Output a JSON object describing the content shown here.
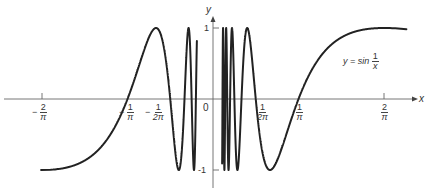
{
  "chart_data": {
    "type": "line",
    "function": "sin(1/x)",
    "xlabel": "x",
    "ylabel": "y",
    "xlim": [
      -0.65,
      0.72
    ],
    "ylim": [
      -1,
      1
    ],
    "x_ticks": [
      {
        "value": -0.6366,
        "label_sign": "-",
        "label_num": "2",
        "label_den": "π"
      },
      {
        "value": -0.3183,
        "label_sign": "-",
        "label_num": "1",
        "label_den": "π"
      },
      {
        "value": -0.1592,
        "label_sign": "-",
        "label_num": "1",
        "label_den": "2π"
      },
      {
        "value": 0.1592,
        "label_sign": "",
        "label_num": "1",
        "label_den": "2π"
      },
      {
        "value": 0.3183,
        "label_sign": "",
        "label_num": "1",
        "label_den": "π"
      },
      {
        "value": 0.6366,
        "label_sign": "",
        "label_num": "2",
        "label_den": "π"
      }
    ],
    "y_ticks": [
      {
        "value": 1,
        "label": "1"
      },
      {
        "value": -1,
        "label": "-1"
      }
    ],
    "origin_label": "0",
    "curve_range_left": [
      -0.64,
      -0.06
    ],
    "curve_range_right": [
      0.034,
      0.72
    ],
    "grid": false
  },
  "labels": {
    "x_axis": "x",
    "y_axis": "y",
    "origin": "0",
    "y_one": "1",
    "y_neg_one": "-1",
    "equation_lhs": "y = sin",
    "equation_num": "1",
    "equation_den": "x",
    "tick_neg_2pi_sign": "−",
    "tick_neg_2pi_num": "2",
    "tick_neg_2pi_den": "π",
    "tick_neg_1pi_sign": "−",
    "tick_neg_1pi_num": "1",
    "tick_neg_1pi_den": "π",
    "tick_neg_half_sign": "−",
    "tick_neg_half_num": "1",
    "tick_neg_half_den": "2π",
    "tick_half_num": "1",
    "tick_half_den": "2π",
    "tick_1pi_num": "1",
    "tick_1pi_den": "π",
    "tick_2pi_num": "2",
    "tick_2pi_den": "π"
  },
  "colors": {
    "curve": "#222222",
    "axis": "#555555"
  }
}
